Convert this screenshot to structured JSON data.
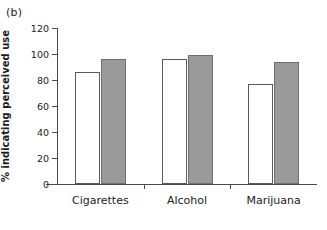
{
  "figure": {
    "panel_label": "(b)",
    "background_color": "#ffffff"
  },
  "chart_data": {
    "type": "bar",
    "title": "(b)",
    "xlabel": "",
    "ylabel": "% indicating perceived use",
    "categories": [
      "Cigarettes",
      "Alcohol",
      "Marijuana"
    ],
    "series": [
      {
        "name": "open",
        "fill": "#ffffff",
        "values": [
          86,
          96,
          77
        ]
      },
      {
        "name": "filled",
        "fill": "#9a9a9a",
        "values": [
          96,
          99.5,
          94
        ]
      }
    ],
    "ylim": [
      0,
      120
    ],
    "yticks": [
      0,
      20,
      40,
      60,
      80,
      100,
      120
    ],
    "ytick_labels": [
      "0",
      "20",
      "40",
      "60",
      "80",
      "100",
      "120"
    ],
    "grid": false,
    "legend": "none"
  },
  "axes": {
    "y_title": "% indicating perceived use",
    "tick_color": "#4a4a4a"
  }
}
